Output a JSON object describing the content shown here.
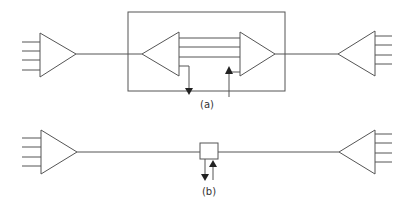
{
  "diagram": {
    "type": "amplifier-link-block-diagram",
    "colors": {
      "line": "#555555",
      "arrowhead": "#222222",
      "background": "#ffffff"
    },
    "panel_a": {
      "label": "(a)",
      "description": "Point-to-point link with an enclosed regenerator/add-drop node (two back-to-back multi-input amplifiers with drop and add arrows)",
      "components": [
        "input-amplifier-4-lines",
        "enclosure-box",
        "inner-left-amplifier",
        "three-parallel-lines",
        "inner-right-amplifier",
        "drop-arrow",
        "add-arrow",
        "output-amplifier-4-lines"
      ]
    },
    "panel_b": {
      "label": "(b)",
      "description": "Point-to-point link with an inline add/drop box on the main line",
      "components": [
        "input-amplifier-4-lines",
        "add-drop-box",
        "drop-arrow",
        "add-arrow",
        "output-amplifier-4-lines"
      ]
    }
  }
}
